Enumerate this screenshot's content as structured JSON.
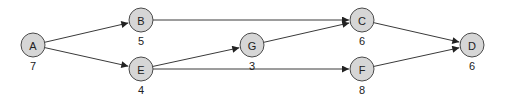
{
  "diagram": {
    "type": "directed-graph",
    "colors": {
      "node_fill": "#d6d6d6",
      "node_stroke": "#4a4a4a",
      "edge": "#3a3a3a",
      "text": "#222222"
    },
    "nodes": [
      {
        "id": "A",
        "label": "A",
        "weight": "7"
      },
      {
        "id": "B",
        "label": "B",
        "weight": "5"
      },
      {
        "id": "E",
        "label": "E",
        "weight": "4"
      },
      {
        "id": "G",
        "label": "G",
        "weight": "3"
      },
      {
        "id": "C",
        "label": "C",
        "weight": "6"
      },
      {
        "id": "F",
        "label": "F",
        "weight": "8"
      },
      {
        "id": "D",
        "label": "D",
        "weight": "6"
      }
    ],
    "edges": [
      {
        "from": "A",
        "to": "B"
      },
      {
        "from": "A",
        "to": "E"
      },
      {
        "from": "B",
        "to": "C"
      },
      {
        "from": "E",
        "to": "G"
      },
      {
        "from": "E",
        "to": "F"
      },
      {
        "from": "G",
        "to": "C"
      },
      {
        "from": "C",
        "to": "D"
      },
      {
        "from": "F",
        "to": "D"
      }
    ]
  }
}
